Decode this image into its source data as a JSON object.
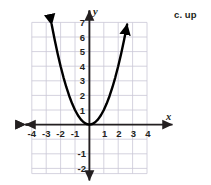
{
  "side_note": {
    "text": "c. up"
  },
  "chart_data": {
    "type": "line",
    "title": "",
    "xlabel": "x",
    "ylabel": "y",
    "function": "y = x^2",
    "xlim": [
      -4.6,
      4.6
    ],
    "ylim": [
      -2.5,
      7.4
    ],
    "grid": true,
    "grid_xrange": [
      -4,
      4
    ],
    "grid_yrange": [
      -2,
      7
    ],
    "legend": "none",
    "x_ticks": [
      -4,
      -3,
      -2,
      -1,
      1,
      2,
      3,
      4
    ],
    "x_tick_labels": [
      "-4",
      "-3",
      "-2",
      "-1",
      "1",
      "2",
      "3",
      "4"
    ],
    "y_ticks": [
      7,
      6,
      5,
      4,
      3,
      2,
      1,
      -1,
      -2
    ],
    "y_tick_labels": [
      "7",
      "6",
      "5",
      "4",
      "3",
      "2",
      "1",
      "-1",
      "-2"
    ],
    "vertex": [
      0,
      0
    ],
    "opens": "up",
    "arrows": [
      "x-left",
      "x-right",
      "y-up",
      "y-down",
      "curve-left",
      "curve-right"
    ],
    "series": [
      {
        "name": "y = x^2",
        "color": "#000000",
        "x": [
          -2.62,
          -2.4,
          -2.2,
          -2.0,
          -1.8,
          -1.6,
          -1.4,
          -1.2,
          -1.0,
          -0.8,
          -0.6,
          -0.4,
          -0.2,
          0,
          0.2,
          0.4,
          0.6,
          0.8,
          1.0,
          1.2,
          1.4,
          1.6,
          1.8,
          2.0,
          2.2,
          2.4,
          2.62
        ],
        "values": [
          6.86,
          5.76,
          4.84,
          4.0,
          3.24,
          2.56,
          1.96,
          1.44,
          1.0,
          0.64,
          0.36,
          0.16,
          0.04,
          0,
          0.04,
          0.16,
          0.36,
          0.64,
          1.0,
          1.44,
          1.96,
          2.56,
          3.24,
          4.0,
          4.84,
          5.76,
          6.86
        ]
      }
    ],
    "colors": {
      "curve": "#000000",
      "axis": "#231f20",
      "grid": "#c9c6d6",
      "label": "#231f20",
      "background": "#ffffff"
    }
  }
}
